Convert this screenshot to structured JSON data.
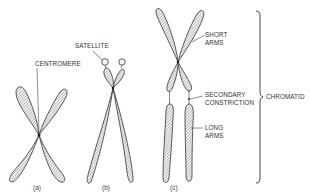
{
  "figure": {
    "panels": [
      {
        "id": "a",
        "caption": "(a)",
        "labels": [
          "CENTROMERE"
        ]
      },
      {
        "id": "b",
        "caption": "(b)",
        "labels": [
          "SATELLITE"
        ]
      },
      {
        "id": "c",
        "caption": "(c)",
        "labels": [
          "SHORT ARMS",
          "SECONDARY CONSTRICTION",
          "LONG ARMS"
        ]
      }
    ],
    "labels": {
      "centromere": "CENTROMERE",
      "satellite": "SATELLITE",
      "short_arms_1": "SHORT",
      "short_arms_2": "ARMS",
      "secondary_1": "SECONDARY",
      "secondary_2": "CONSTRICTION",
      "long_arms_1": "LONG",
      "long_arms_2": "ARMS",
      "chromatid": "CHROMATID"
    },
    "captions": {
      "a": "(a)",
      "b": "(b)",
      "c": "(c)"
    },
    "colors": {
      "outline": "#333333",
      "hatch": "#777777",
      "background": "#ffffff"
    }
  }
}
